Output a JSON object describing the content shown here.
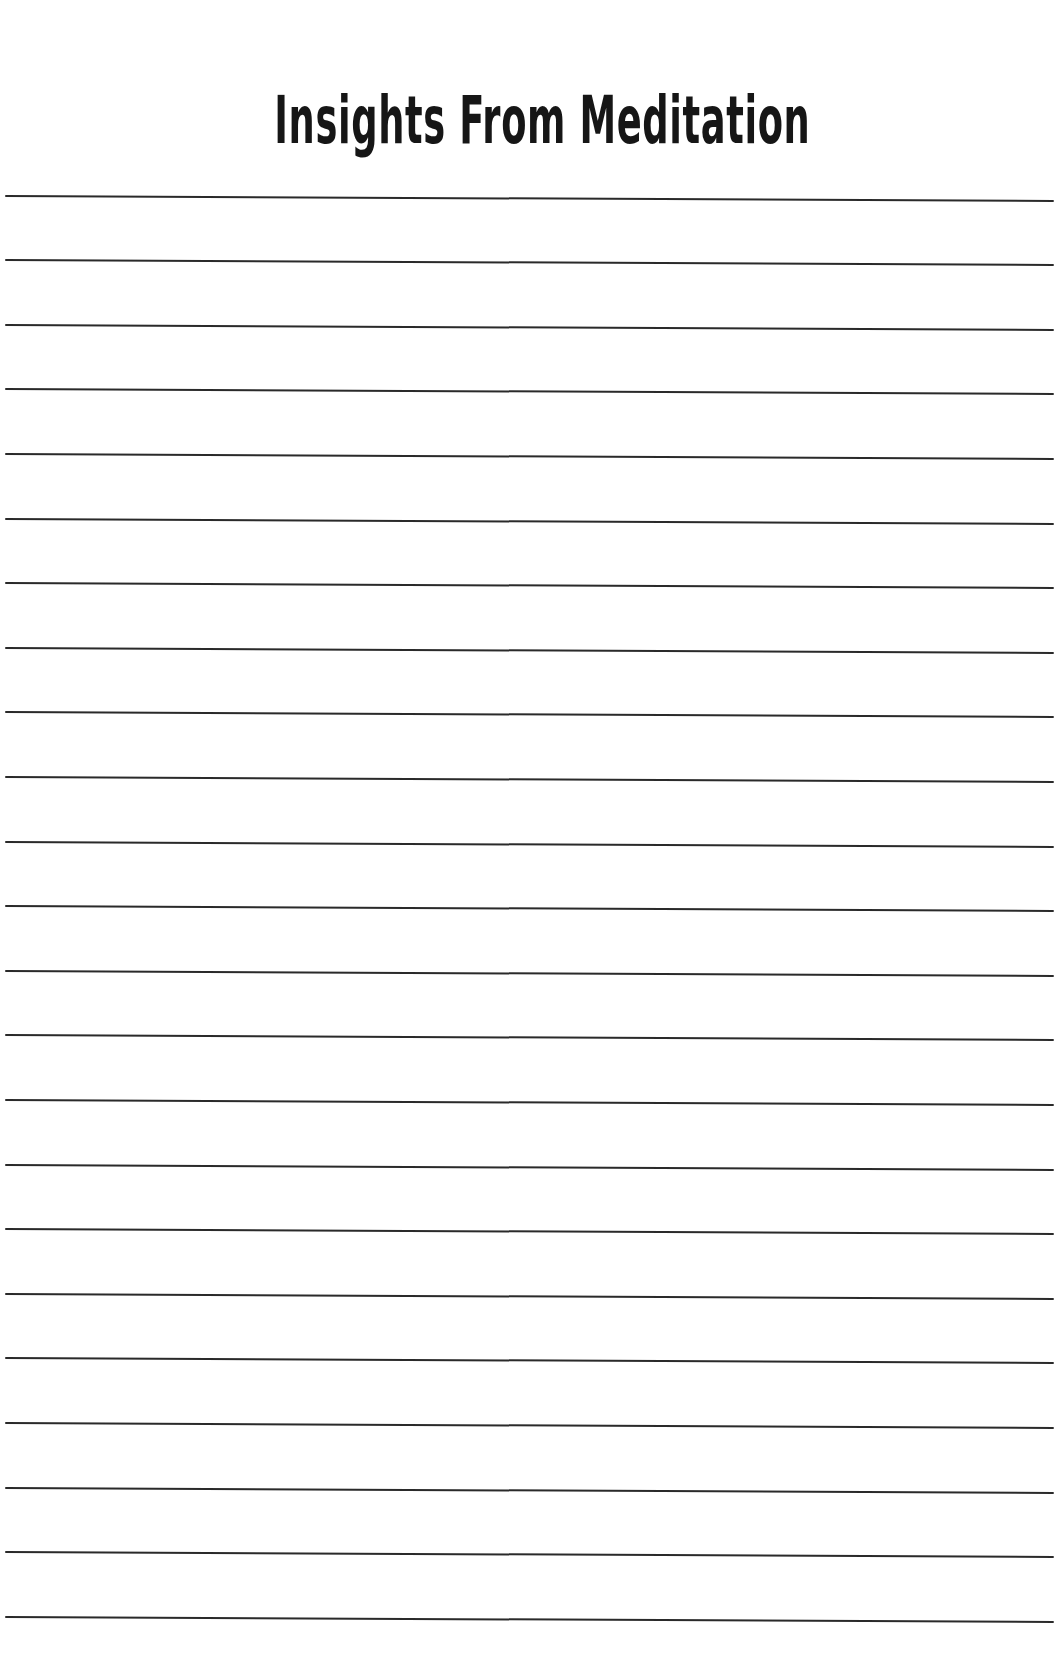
{
  "page": {
    "title": "Insights From Meditation",
    "background_color": "#ffffff",
    "line_color": "#2a2a2a",
    "ruled_line_count": 23,
    "ruled_lines_top_y": [
      195,
      259,
      324,
      388,
      453,
      518,
      582,
      647,
      711,
      776,
      841,
      905,
      970,
      1034,
      1099,
      1164,
      1228,
      1293,
      1357,
      1422,
      1487,
      1551,
      1616
    ]
  }
}
